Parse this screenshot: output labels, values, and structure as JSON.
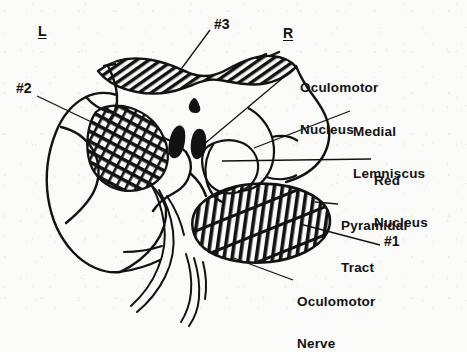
{
  "figure": {
    "ink_color": "#121212",
    "paper_color": "#fbfbfa"
  },
  "orientation": {
    "left_mark": "L",
    "right_mark": "R"
  },
  "lesion_markers": [
    {
      "id": "lesion-3",
      "label": "#3",
      "x": 214,
      "y": 24,
      "target_x": 183,
      "target_y": 70
    },
    {
      "id": "lesion-2",
      "label": "#2",
      "x": 16,
      "y": 88,
      "target_x": 101,
      "target_y": 126
    },
    {
      "id": "lesion-1",
      "label": "#1",
      "x": 384,
      "y": 240,
      "target_x": 307,
      "target_y": 222
    }
  ],
  "structure_labels": [
    {
      "id": "oculomotor-nucleus",
      "lines": [
        "Oculomotor",
        "Nucleus"
      ],
      "x": 300,
      "y": 59,
      "leader": {
        "x1": 296,
        "y1": 66,
        "x2": 203,
        "y2": 144
      }
    },
    {
      "id": "medial-lemniscus",
      "lines": [
        "Medial",
        "Lemniscus"
      ],
      "x": 353,
      "y": 103,
      "leader": {
        "x1": 350,
        "y1": 111,
        "x2": 255,
        "y2": 148
      }
    },
    {
      "id": "red-nucleus",
      "lines": [
        "Red",
        "Nucleus"
      ],
      "x": 374,
      "y": 152,
      "leader": {
        "x1": 371,
        "y1": 159,
        "x2": 224,
        "y2": 161
      }
    },
    {
      "id": "pyramidal-tract",
      "lines": [
        "Pyramidal",
        "Tract"
      ],
      "x": 341,
      "y": 197,
      "leader": {
        "x1": 338,
        "y1": 204,
        "x2": 318,
        "y2": 202
      }
    },
    {
      "id": "oculomotor-nerve",
      "lines": [
        "Oculomotor",
        "Nerve"
      ],
      "x": 297,
      "y": 273,
      "leader": {
        "x1": 293,
        "y1": 280,
        "x2": 232,
        "y2": 256
      }
    }
  ],
  "shaded_regions": [
    {
      "id": "tectum-band",
      "pattern": "diagonal-hatch",
      "description": "wavy hatched dorsal band"
    },
    {
      "id": "left-peduncle",
      "pattern": "cross-hatch",
      "description": "left cerebral peduncle lesion"
    },
    {
      "id": "right-peduncle",
      "pattern": "vertical-cross",
      "description": "right cerebral peduncle / pyramidal tract"
    }
  ]
}
